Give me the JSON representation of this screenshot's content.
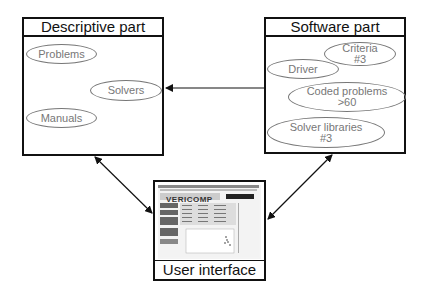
{
  "descriptive_part": {
    "title": "Descriptive part",
    "items": [
      {
        "label": "Problems"
      },
      {
        "label": "Solvers"
      },
      {
        "label": "Manuals"
      }
    ]
  },
  "software_part": {
    "title": "Software part",
    "items": [
      {
        "label": "Criteria",
        "sub": "#3"
      },
      {
        "label": "Driver",
        "sub": ""
      },
      {
        "label": "Coded problems",
        "sub": ">60"
      },
      {
        "label": "Solver libraries",
        "sub": "#3"
      }
    ]
  },
  "user_interface": {
    "title": "User interface",
    "screenshot_logo": "VERICOMP"
  },
  "arrows": [
    {
      "from": "software_part",
      "to": "descriptive_part",
      "type": "single"
    },
    {
      "from": "descriptive_part",
      "to": "user_interface",
      "type": "double"
    },
    {
      "from": "software_part",
      "to": "user_interface",
      "type": "double"
    }
  ]
}
